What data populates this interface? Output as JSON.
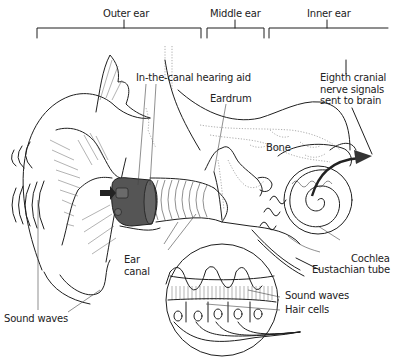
{
  "figure": {
    "sections": [
      {
        "label": "Outer ear"
      },
      {
        "label": "Middle ear"
      },
      {
        "label": "Inner ear"
      }
    ],
    "labels": {
      "hearing_aid": "In-the-canal hearing aid",
      "eardrum": "Eardrum",
      "bone": "Bone",
      "nerve": "Eighth cranial\nnerve signals\nsent to brain",
      "cochlea": "Cochlea",
      "eustachian_tube": "Eustachian tube",
      "ear_canal": "Ear\ncanal",
      "sound_waves_outer": "Sound waves",
      "sound_waves_inset": "Sound waves",
      "hair_cells": "Hair cells"
    },
    "colors": {
      "line": "#1f1f1f",
      "hearing_aid_fill": "#555555",
      "background": "#ffffff"
    }
  }
}
